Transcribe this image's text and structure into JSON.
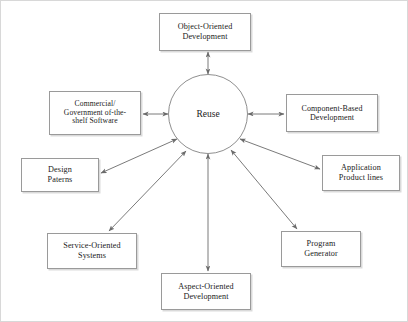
{
  "diagram": {
    "center": {
      "label": "Reuse",
      "cx": 207,
      "cy": 113,
      "r": 40,
      "font_size": 9.5
    },
    "style": {
      "box_border_color": "#9a9a9a",
      "circle_border_color": "#8f8f8f",
      "arrow_color": "#6b6b6b",
      "text_color": "#1a1a1a",
      "page_border_color": "#d8d8d8",
      "background": "#ffffff"
    },
    "nodes": [
      {
        "id": "object-oriented-development",
        "label": "Object-Oriented\nDevelopment",
        "x": 158,
        "y": 12,
        "w": 92,
        "h": 38,
        "font_size": 8.2
      },
      {
        "id": "commercial-government-off-the-shelf-software",
        "label": "Commercial/\nGovernment of-the-\nshelf Software",
        "x": 48,
        "y": 90,
        "w": 92,
        "h": 44,
        "font_size": 7.6
      },
      {
        "id": "component-based-development",
        "label": "Component-Based\nDevelopment",
        "x": 285,
        "y": 93,
        "w": 92,
        "h": 38,
        "font_size": 8.0
      },
      {
        "id": "design-patterns",
        "label": "Design\nPaterns",
        "x": 20,
        "y": 157,
        "w": 78,
        "h": 34,
        "font_size": 8.2
      },
      {
        "id": "application-product-lines",
        "label": "Application\nProduct lines",
        "x": 321,
        "y": 154,
        "w": 78,
        "h": 36,
        "font_size": 8.2
      },
      {
        "id": "service-oriented-systems",
        "label": "Service-Oriented\nSystems",
        "x": 46,
        "y": 232,
        "w": 90,
        "h": 36,
        "font_size": 8.2
      },
      {
        "id": "program-generator",
        "label": "Program\nGenerator",
        "x": 280,
        "y": 230,
        "w": 80,
        "h": 36,
        "font_size": 8.2
      },
      {
        "id": "aspect-oriented-development",
        "label": "Aspect-Oriented\nDevelopment",
        "x": 160,
        "y": 272,
        "w": 90,
        "h": 37,
        "font_size": 8.2
      }
    ],
    "connectors": [
      {
        "id": "reuse-to-object-oriented-development",
        "from": "center",
        "to": "object-oriented-development",
        "x1": 207,
        "y1": 73,
        "x2": 207,
        "y2": 51,
        "arrows": "both"
      },
      {
        "id": "reuse-to-cots-software",
        "from": "center",
        "to": "commercial-government-off-the-shelf-software",
        "x1": 167,
        "y1": 113,
        "x2": 142,
        "y2": 113,
        "arrows": "both"
      },
      {
        "id": "reuse-to-component-based-development",
        "from": "center",
        "to": "component-based-development",
        "x1": 247,
        "y1": 113,
        "x2": 283,
        "y2": 113,
        "arrows": "both"
      },
      {
        "id": "reuse-to-design-patterns",
        "from": "center",
        "to": "design-patterns",
        "x1": 176,
        "y1": 138,
        "x2": 100,
        "y2": 172,
        "arrows": "both"
      },
      {
        "id": "reuse-to-application-product-lines",
        "from": "center",
        "to": "application-product-lines",
        "x1": 239,
        "y1": 138,
        "x2": 319,
        "y2": 168,
        "arrows": "both"
      },
      {
        "id": "reuse-to-service-oriented-systems",
        "from": "center",
        "to": "service-oriented-systems",
        "x1": 185,
        "y1": 150,
        "x2": 108,
        "y2": 230,
        "arrows": "both"
      },
      {
        "id": "reuse-to-program-generator",
        "from": "center",
        "to": "program-generator",
        "x1": 230,
        "y1": 149,
        "x2": 296,
        "y2": 228,
        "arrows": "both"
      },
      {
        "id": "reuse-to-aspect-oriented-development",
        "from": "center",
        "to": "aspect-oriented-development",
        "x1": 207,
        "y1": 153,
        "x2": 207,
        "y2": 270,
        "arrows": "both"
      }
    ]
  }
}
